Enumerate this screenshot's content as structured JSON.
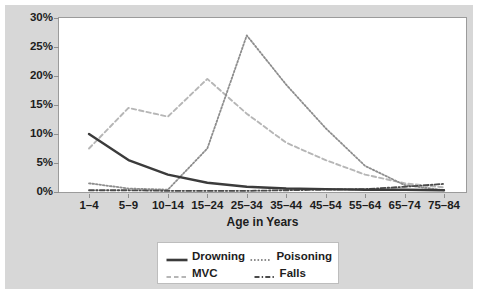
{
  "chart_data": {
    "type": "line",
    "title": "",
    "xlabel": "Age in Years",
    "ylabel": "",
    "categories": [
      "1–4",
      "5–9",
      "10–14",
      "15–24",
      "25–34",
      "35–44",
      "45–54",
      "55–64",
      "65–74",
      "75–84"
    ],
    "ylim": [
      0,
      30
    ],
    "ytick_values": [
      0,
      5,
      10,
      15,
      20,
      25,
      30
    ],
    "ytick_labels": [
      "0%",
      "5%",
      "10%",
      "15%",
      "20%",
      "25%",
      "30%"
    ],
    "grid": false,
    "legend_position": "bottom-center",
    "series": [
      {
        "name": "Drowning",
        "style": "solid",
        "color": "#3b3b3b",
        "values": [
          10.0,
          5.5,
          3.0,
          1.6,
          0.9,
          0.6,
          0.5,
          0.4,
          0.4,
          0.3
        ]
      },
      {
        "name": "Poisoning",
        "style": "dotted",
        "color": "#8d8d8d",
        "values": [
          1.5,
          0.6,
          0.4,
          7.5,
          27.0,
          18.5,
          11.0,
          4.5,
          1.2,
          0.3
        ]
      },
      {
        "name": "MVC",
        "style": "dashed",
        "color": "#b6b6b6",
        "values": [
          7.5,
          14.5,
          13.0,
          19.5,
          13.5,
          8.5,
          5.5,
          3.0,
          1.5,
          0.8
        ]
      },
      {
        "name": "Falls",
        "style": "dash-dot",
        "color": "#4a4a4a",
        "values": [
          0.3,
          0.3,
          0.2,
          0.2,
          0.2,
          0.3,
          0.4,
          0.5,
          0.9,
          1.4
        ]
      }
    ]
  },
  "legend": {
    "items": [
      {
        "label": "Drowning",
        "swatch": "line-solid-swatch"
      },
      {
        "label": "Poisoning",
        "swatch": "line-dotted-swatch"
      },
      {
        "label": "MVC",
        "swatch": "line-dashed-swatch"
      },
      {
        "label": "Falls",
        "swatch": "line-dash-dot-swatch"
      }
    ]
  },
  "colors": {
    "figure_background": "#d7d7d7",
    "plot_background": "#ffffff",
    "axis": "#9b9b9b",
    "text": "#1d1d1d"
  }
}
